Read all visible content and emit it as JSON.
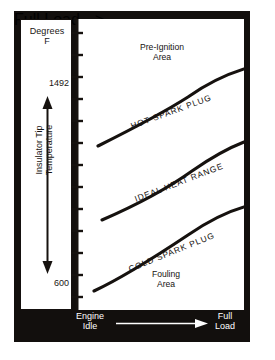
{
  "figure": {
    "background_color": "#ffffff",
    "plate_color": "#120f0d",
    "ink_color": "#16120f"
  },
  "y_axis": {
    "unit_label_line1": "Degrees",
    "unit_label_line2": "F",
    "title": "Insulator Tip\nTemperature",
    "ticks": [
      {
        "label": "1500",
        "value": 1500
      },
      {
        "label": "600",
        "value": 600
      }
    ],
    "tick_count": 13,
    "range": [
      600,
      1500
    ]
  },
  "x_axis": {
    "left_label_line1": "Engine",
    "left_label_line2": "Idle",
    "right_label_line1": "Full",
    "right_label_line2": "Load",
    "arrow_direction": "left-to-right"
  },
  "regions": [
    {
      "name": "pre-ignition",
      "label_line1": "Pre-Ignition",
      "label_line2": "Area",
      "position": "top",
      "fill": "stipple-dense-top"
    },
    {
      "name": "fouling",
      "label_line1": "Fouling",
      "label_line2": "Area",
      "position": "bottom",
      "fill": "stipple-dense-bottom"
    }
  ],
  "chart_data": {
    "type": "line",
    "xlabel": "Engine Idle to Full Load",
    "ylabel": "Insulator Tip Temperature (Degrees F)",
    "ylim": [
      600,
      1500
    ],
    "grid": false,
    "legend": "inline-on-curve",
    "annotations": [
      "Pre-Ignition Area",
      "Fouling Area"
    ],
    "series": [
      {
        "name": "HOT SPARK PLUG",
        "label": "HOT SPARK PLUG",
        "x": [
          0,
          0.15,
          0.3,
          0.45,
          0.6,
          0.75,
          0.9,
          1.0
        ],
        "y": [
          1115,
          1165,
          1215,
          1262,
          1310,
          1368,
          1438,
          1492
        ]
      },
      {
        "name": "IDEAL HEAT RANGE",
        "label": "IDEAL HEAT RANGE",
        "x": [
          0,
          0.15,
          0.3,
          0.45,
          0.6,
          0.75,
          0.9,
          1.0
        ],
        "y": [
          885,
          925,
          962,
          1000,
          1040,
          1090,
          1160,
          1218
        ]
      },
      {
        "name": "COLD SPARK PLUG",
        "label": "COLD SPARK PLUG",
        "x": [
          0,
          0.15,
          0.3,
          0.45,
          0.6,
          0.75,
          0.9,
          1.0
        ],
        "y": [
          608,
          660,
          710,
          755,
          800,
          850,
          920,
          978
        ]
      }
    ]
  }
}
